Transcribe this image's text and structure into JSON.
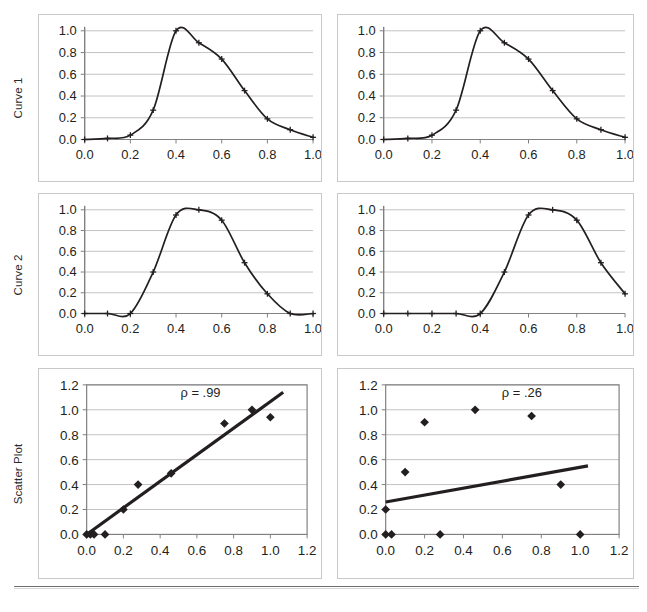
{
  "figure": {
    "row_labels": [
      "Curve 1",
      "Curve 2",
      "Scatter Plot"
    ],
    "colors": {
      "line": "#231f20",
      "grid": "#b3b3b3",
      "axis": "#808080",
      "frame": "#808080",
      "panel_border": "#c9c9c9",
      "text": "#231f20",
      "background": "#ffffff"
    }
  },
  "chart_data": [
    {
      "id": "curve1-left",
      "type": "line",
      "title": "",
      "row": "Curve 1",
      "column": "left",
      "xlabel": "",
      "ylabel": "",
      "xlim": [
        0.0,
        1.0
      ],
      "ylim": [
        0.0,
        1.0
      ],
      "xticks": [
        "0.0",
        "0.2",
        "0.4",
        "0.6",
        "0.8",
        "1.0"
      ],
      "xtick_values": [
        0.0,
        0.2,
        0.4,
        0.6,
        0.8,
        1.0
      ],
      "yticks": [
        "0.0",
        "0.2",
        "0.4",
        "0.6",
        "0.8",
        "1.0"
      ],
      "ytick_values": [
        0.0,
        0.2,
        0.4,
        0.6,
        0.8,
        1.0
      ],
      "grid": "horizontal",
      "legend": "none",
      "marker": "cross",
      "x": [
        0.0,
        0.1,
        0.2,
        0.3,
        0.4,
        0.5,
        0.6,
        0.7,
        0.8,
        0.9,
        1.0
      ],
      "values": [
        0.0,
        0.01,
        0.04,
        0.27,
        1.0,
        0.89,
        0.74,
        0.45,
        0.19,
        0.09,
        0.02
      ]
    },
    {
      "id": "curve1-right",
      "type": "line",
      "title": "",
      "row": "Curve 1",
      "column": "right",
      "xlabel": "",
      "ylabel": "",
      "xlim": [
        0.0,
        1.0
      ],
      "ylim": [
        0.0,
        1.0
      ],
      "xticks": [
        "0.0",
        "0.2",
        "0.4",
        "0.6",
        "0.8",
        "1.0"
      ],
      "xtick_values": [
        0.0,
        0.2,
        0.4,
        0.6,
        0.8,
        1.0
      ],
      "yticks": [
        "0.0",
        "0.2",
        "0.4",
        "0.6",
        "0.8",
        "1.0"
      ],
      "ytick_values": [
        0.0,
        0.2,
        0.4,
        0.6,
        0.8,
        1.0
      ],
      "grid": "horizontal",
      "legend": "none",
      "marker": "cross",
      "x": [
        0.0,
        0.1,
        0.2,
        0.3,
        0.4,
        0.5,
        0.6,
        0.7,
        0.8,
        0.9,
        1.0
      ],
      "values": [
        0.0,
        0.01,
        0.04,
        0.27,
        1.0,
        0.89,
        0.74,
        0.45,
        0.19,
        0.09,
        0.02
      ]
    },
    {
      "id": "curve2-left",
      "type": "line",
      "title": "",
      "row": "Curve 2",
      "column": "left",
      "xlabel": "",
      "ylabel": "",
      "xlim": [
        0.0,
        1.0
      ],
      "ylim": [
        0.0,
        1.0
      ],
      "xticks": [
        "0.0",
        "0.2",
        "0.4",
        "0.6",
        "0.8",
        "1.0"
      ],
      "xtick_values": [
        0.0,
        0.2,
        0.4,
        0.6,
        0.8,
        1.0
      ],
      "yticks": [
        "0.0",
        "0.2",
        "0.4",
        "0.6",
        "0.8",
        "1.0"
      ],
      "ytick_values": [
        0.0,
        0.2,
        0.4,
        0.6,
        0.8,
        1.0
      ],
      "grid": "horizontal",
      "legend": "none",
      "marker": "cross",
      "x": [
        0.0,
        0.1,
        0.2,
        0.3,
        0.4,
        0.5,
        0.6,
        0.7,
        0.8,
        0.9,
        1.0
      ],
      "values": [
        0.0,
        0.0,
        0.0,
        0.4,
        0.95,
        1.0,
        0.9,
        0.49,
        0.19,
        0.0,
        0.0
      ]
    },
    {
      "id": "curve2-right",
      "type": "line",
      "title": "",
      "row": "Curve 2",
      "column": "right",
      "xlabel": "",
      "ylabel": "",
      "xlim": [
        0.0,
        1.0
      ],
      "ylim": [
        0.0,
        1.0
      ],
      "xticks": [
        "0.0",
        "0.2",
        "0.4",
        "0.6",
        "0.8",
        "1.0"
      ],
      "xtick_values": [
        0.0,
        0.2,
        0.4,
        0.6,
        0.8,
        1.0
      ],
      "yticks": [
        "0.0",
        "0.2",
        "0.4",
        "0.6",
        "0.8",
        "1.0"
      ],
      "ytick_values": [
        0.0,
        0.2,
        0.4,
        0.6,
        0.8,
        1.0
      ],
      "grid": "horizontal",
      "legend": "none",
      "marker": "cross",
      "x": [
        0.0,
        0.1,
        0.2,
        0.3,
        0.4,
        0.5,
        0.6,
        0.7,
        0.8,
        0.9,
        1.0
      ],
      "values": [
        0.0,
        0.0,
        0.0,
        0.0,
        0.0,
        0.4,
        0.95,
        1.0,
        0.9,
        0.49,
        0.19
      ]
    },
    {
      "id": "scatter-left",
      "type": "scatter",
      "title": "",
      "row": "Scatter Plot",
      "column": "left",
      "xlabel": "",
      "ylabel": "",
      "xlim": [
        0.0,
        1.2
      ],
      "ylim": [
        0.0,
        1.2
      ],
      "xticks": [
        "0.0",
        "0.2",
        "0.4",
        "0.6",
        "0.8",
        "1.0",
        "1.2"
      ],
      "xtick_values": [
        0.0,
        0.2,
        0.4,
        0.6,
        0.8,
        1.0,
        1.2
      ],
      "yticks": [
        "0.0",
        "0.2",
        "0.4",
        "0.6",
        "0.8",
        "1.0",
        "1.2"
      ],
      "ytick_values": [
        0.0,
        0.2,
        0.4,
        0.6,
        0.8,
        1.0,
        1.2
      ],
      "grid": "horizontal",
      "frame": true,
      "legend": "none",
      "marker": "diamond",
      "annotation": "ρ = .99",
      "annotation_x": 0.62,
      "annotation_y": 1.1,
      "points": [
        [
          0.0,
          0.0
        ],
        [
          0.02,
          0.0
        ],
        [
          0.04,
          0.0
        ],
        [
          0.1,
          0.0
        ],
        [
          0.2,
          0.2
        ],
        [
          0.28,
          0.4
        ],
        [
          0.46,
          0.49
        ],
        [
          0.75,
          0.89
        ],
        [
          0.9,
          1.0
        ],
        [
          1.0,
          0.94
        ]
      ],
      "trendline": {
        "x0": 0.0,
        "y0": 0.0,
        "x1": 1.07,
        "y1": 1.14
      }
    },
    {
      "id": "scatter-right",
      "type": "scatter",
      "title": "",
      "row": "Scatter Plot",
      "column": "right",
      "xlabel": "",
      "ylabel": "",
      "xlim": [
        0.0,
        1.2
      ],
      "ylim": [
        0.0,
        1.2
      ],
      "xticks": [
        "0.0",
        "0.2",
        "0.4",
        "0.6",
        "0.8",
        "1.0",
        "1.2"
      ],
      "xtick_values": [
        0.0,
        0.2,
        0.4,
        0.6,
        0.8,
        1.0,
        1.2
      ],
      "yticks": [
        "0.0",
        "0.2",
        "0.4",
        "0.6",
        "0.8",
        "1.0",
        "1.2"
      ],
      "ytick_values": [
        0.0,
        0.2,
        0.4,
        0.6,
        0.8,
        1.0,
        1.2
      ],
      "grid": "horizontal",
      "frame": true,
      "legend": "none",
      "marker": "diamond",
      "annotation": "ρ = .26",
      "annotation_x": 0.7,
      "annotation_y": 1.1,
      "points": [
        [
          0.0,
          0.0
        ],
        [
          0.03,
          0.0
        ],
        [
          0.28,
          0.0
        ],
        [
          1.0,
          0.0
        ],
        [
          0.0,
          0.2
        ],
        [
          0.1,
          0.5
        ],
        [
          0.2,
          0.9
        ],
        [
          0.46,
          1.0
        ],
        [
          0.75,
          0.95
        ],
        [
          0.9,
          0.4
        ]
      ],
      "trendline": {
        "x0": 0.0,
        "y0": 0.26,
        "x1": 1.04,
        "y1": 0.55
      }
    }
  ]
}
